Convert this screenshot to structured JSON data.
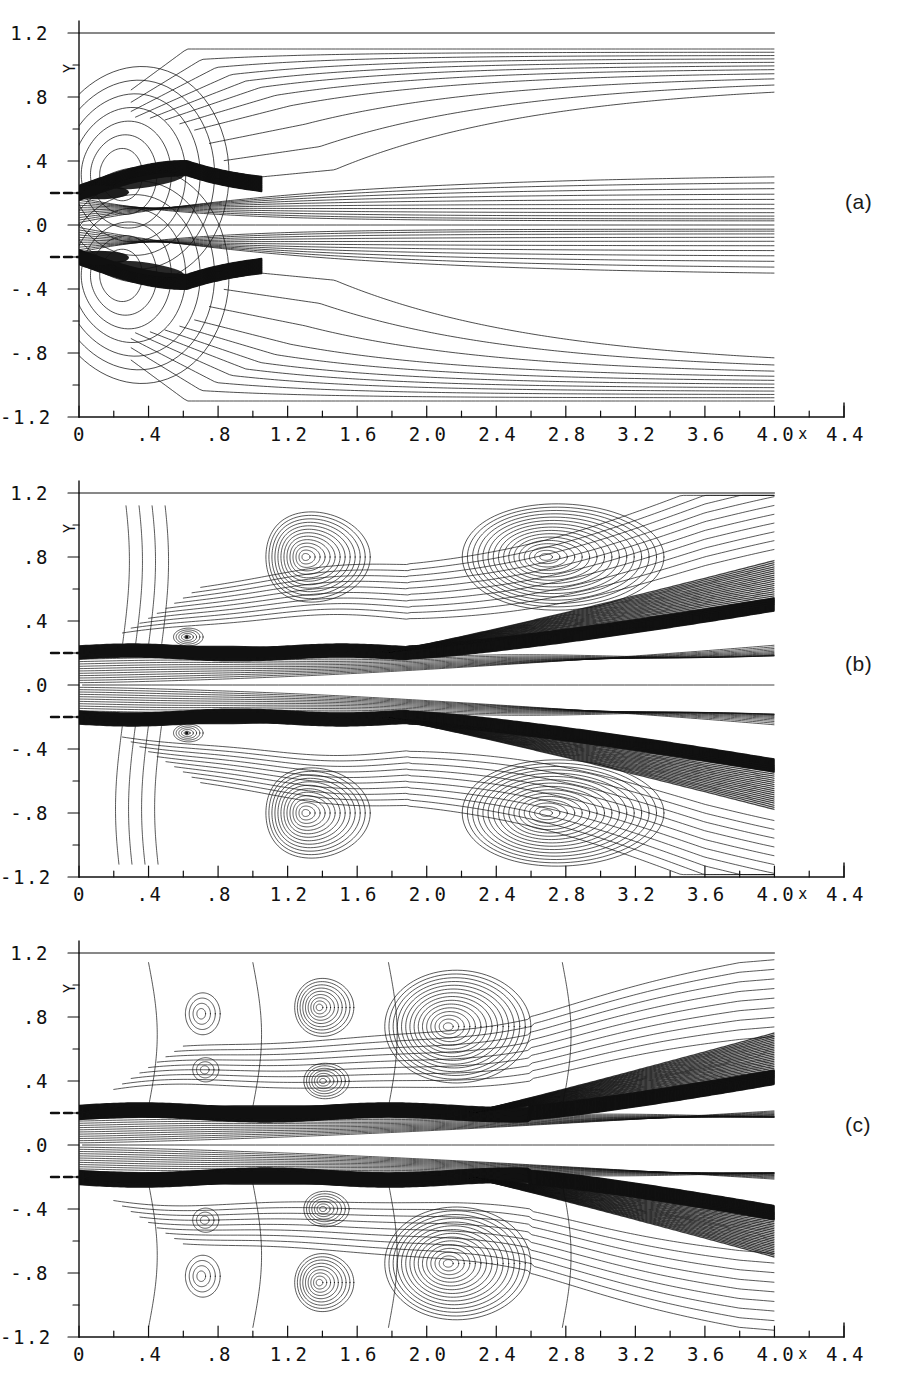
{
  "figure": {
    "title": "",
    "panels": [
      {
        "tag": "(a)"
      },
      {
        "tag": "(b)"
      },
      {
        "tag": "(c)"
      }
    ]
  },
  "axes": {
    "x_name": "X",
    "y_name": "Y",
    "x_ticks": [
      "0",
      ".4",
      ".8",
      "1.2",
      "1.6",
      "2.0",
      "2.4",
      "2.8",
      "3.2",
      "3.6",
      "4.0",
      "4.4"
    ],
    "y_ticks": [
      "1.2",
      ".8",
      ".4",
      ".0",
      "-.4",
      "-.8",
      "-1.2"
    ],
    "x_minor_step": 0.2,
    "y_minor_step": 0.2,
    "nozzle_lip_ticks": [
      0.2,
      -0.2
    ]
  },
  "chart_data": {
    "type": "line",
    "title": "",
    "xlabel": "X",
    "ylabel": "Y",
    "xlim": [
      0,
      4.4
    ],
    "ylim": [
      -1.2,
      1.2
    ],
    "data_xlim": [
      0,
      4.0
    ],
    "grid": false,
    "legend": "none",
    "x_ticks": [
      0,
      0.4,
      0.8,
      1.2,
      1.6,
      2.0,
      2.4,
      2.8,
      3.2,
      3.6,
      4.0,
      4.4
    ],
    "y_ticks": [
      1.2,
      0.8,
      0.4,
      0.0,
      -0.4,
      -0.8,
      -1.2
    ],
    "panels": [
      {
        "tag": "(a)",
        "annotation": "Early stage: attached shear layers with a single pair of counter-rotating recirculation cells near the nozzle; streamlines spread smoothly downstream.",
        "shear_layer_y": [
          0.2,
          -0.2
        ],
        "shear_layer_spread": "monotonic, thin, deflecting outward to y = +/-0.35 by x = 0.8 then straightening",
        "vortex_centers": [
          {
            "x": 0.22,
            "y": 0.3
          },
          {
            "x": 0.22,
            "y": -0.3
          }
        ],
        "outer_streamline_levels": [
          1.1,
          1.02,
          0.96,
          0.9,
          0.84,
          0.78,
          0.72,
          0.64,
          0.5,
          0.32,
          0.14
        ],
        "core_streamline_count": 22
      },
      {
        "tag": "(b)",
        "annotation": "Intermediate stage: shear layers roll up, large counter-rotating vortices form at x ~ 1.3 and x ~ 2.6; shear layer flares outward past x = 2.0.",
        "shear_layer_y": [
          0.2,
          -0.2
        ],
        "shear_layer_spread": "wavy to x = 2.0, then broad outward flare reaching y = +/-0.55 at x = 4.0",
        "vortex_centers": [
          {
            "x": 0.62,
            "y": 0.29
          },
          {
            "x": 0.62,
            "y": -0.29
          },
          {
            "x": 1.3,
            "y": 0.8
          },
          {
            "x": 1.3,
            "y": -0.8
          },
          {
            "x": 2.65,
            "y": 0.8
          },
          {
            "x": 2.65,
            "y": -0.8
          }
        ],
        "core_streamline_count": 24
      },
      {
        "tag": "(c)",
        "annotation": "Late stage: vortex train of three large eddies per side centred near x = 1.4 and x = 2.1 with smaller cells near x = 0.7; shear layer thickens strongly downstream of x = 2.8.",
        "shear_layer_y": [
          0.2,
          -0.2
        ],
        "shear_layer_spread": "thick banded layer, flaring to y = +/-0.45 at x = 4.0",
        "vortex_centers": [
          {
            "x": 0.7,
            "y": 0.82
          },
          {
            "x": 0.7,
            "y": -0.82
          },
          {
            "x": 0.72,
            "y": 0.47
          },
          {
            "x": 0.72,
            "y": -0.47
          },
          {
            "x": 1.38,
            "y": 0.85
          },
          {
            "x": 1.38,
            "y": -0.85
          },
          {
            "x": 1.4,
            "y": 0.4
          },
          {
            "x": 1.4,
            "y": -0.4
          },
          {
            "x": 2.12,
            "y": 0.73
          },
          {
            "x": 2.12,
            "y": -0.73
          }
        ],
        "core_streamline_count": 26
      }
    ]
  }
}
